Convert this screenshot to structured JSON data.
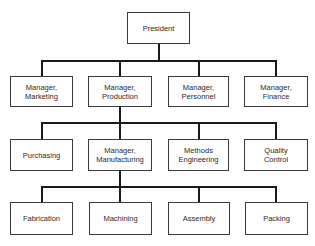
{
  "chart": {
    "type": "organization-chart",
    "root": {
      "label": "President"
    },
    "level2": [
      {
        "line1": "Manager,",
        "line2": "Marketing"
      },
      {
        "line1": "Manager,",
        "line2": "Production"
      },
      {
        "line1": "Manager,",
        "line2": "Personnel"
      },
      {
        "line1": "Manager,",
        "line2": "Finance"
      }
    ],
    "level3": [
      {
        "line1": "Purchasing",
        "line2": ""
      },
      {
        "line1": "Manager,",
        "line2": "Manufacturing"
      },
      {
        "line1": "Methods",
        "line2": "Engineering"
      },
      {
        "line1": "Quality",
        "line2": "Control"
      }
    ],
    "level4": [
      {
        "line1": "Fabrication"
      },
      {
        "line1": "Machining"
      },
      {
        "line1": "Assembly"
      },
      {
        "line1": "Packing"
      }
    ]
  }
}
